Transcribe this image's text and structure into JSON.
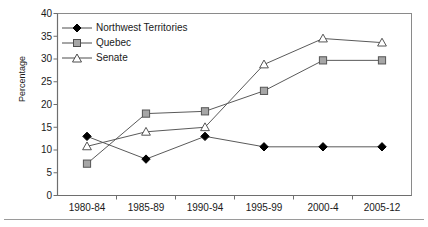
{
  "chart_data": {
    "type": "line",
    "title": "",
    "xlabel": "",
    "ylabel": "Percentage",
    "categories": [
      "1980-84",
      "1985-89",
      "1990-94",
      "1995-99",
      "2000-4",
      "2005-12"
    ],
    "ylim": [
      0,
      40
    ],
    "yticks": [
      0,
      5,
      10,
      15,
      20,
      25,
      30,
      35,
      40
    ],
    "grid": false,
    "legend_position": "top-left",
    "series": [
      {
        "name": "Northwest Territories",
        "marker": "filled-diamond",
        "color": "#000000",
        "values": [
          13.0,
          8.0,
          13.0,
          10.7,
          10.7,
          10.7
        ]
      },
      {
        "name": "Quebec",
        "marker": "filled-square",
        "color": "#999999",
        "values": [
          7.0,
          18.0,
          18.5,
          23.0,
          29.7,
          29.7
        ]
      },
      {
        "name": "Senate",
        "marker": "open-triangle",
        "color": "#666666",
        "values": [
          10.8,
          14.0,
          15.0,
          28.8,
          34.5,
          33.6
        ]
      }
    ]
  },
  "axis": {
    "ylabel": "Percentage",
    "ytick_labels": [
      "40",
      "35",
      "30",
      "25",
      "20",
      "15",
      "10",
      "5",
      "0"
    ],
    "xtick_labels": [
      "1980-84",
      "1985-89",
      "1990-94",
      "1995-99",
      "2000-4",
      "2005-12"
    ]
  },
  "legend": {
    "items": [
      {
        "label": "Northwest Territories"
      },
      {
        "label": "Quebec"
      },
      {
        "label": "Senate"
      }
    ]
  },
  "colors": {
    "nwt": "#000000",
    "quebec": "#999999",
    "senate": "#666666",
    "axis": "#808080",
    "text": "#1a1a1a"
  }
}
